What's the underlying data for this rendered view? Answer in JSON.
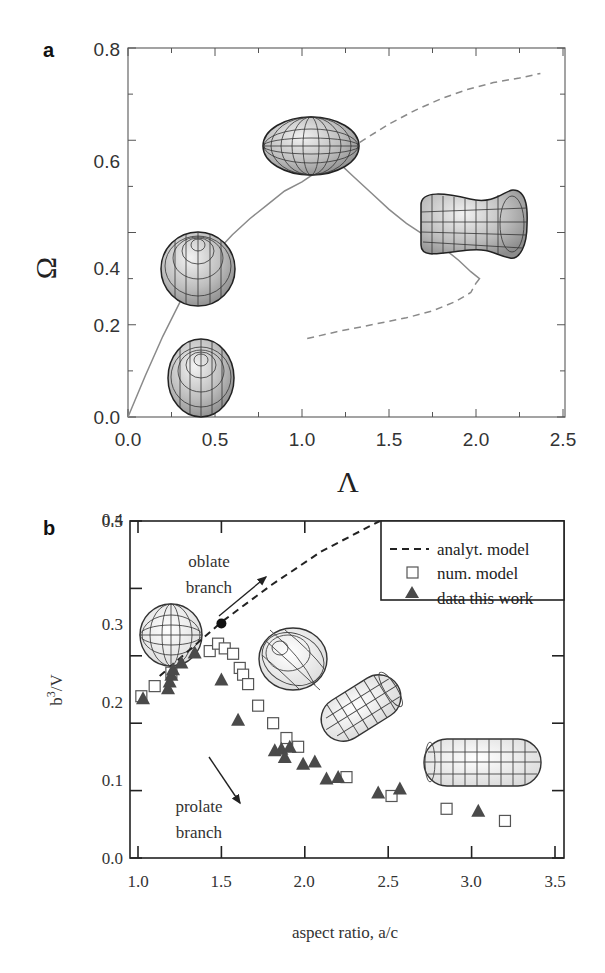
{
  "chart_data": [
    {
      "panel": "a",
      "type": "line",
      "title": "",
      "xlabel": "Λ",
      "ylabel": "Ω",
      "xlim": [
        0.0,
        2.5
      ],
      "ylim": [
        0.0,
        0.8
      ],
      "xticks": [
        "0.0",
        "0.5",
        "1.0",
        "1.5",
        "2.0",
        "2.5"
      ],
      "yticks": [
        "0.0",
        "0.2",
        "0.4",
        "0.6",
        "0.8"
      ],
      "grid": false,
      "series": [
        {
          "name": "stable branch (solid)",
          "style": "solid",
          "x": [
            0.0,
            0.1,
            0.2,
            0.3,
            0.4,
            0.5,
            0.6,
            0.7,
            0.8,
            0.9,
            1.0,
            1.1,
            1.2,
            1.3,
            1.4,
            1.5,
            1.6,
            1.7,
            1.8,
            1.9,
            1.97,
            2.02,
            2.0
          ],
          "y": [
            0.0,
            0.09,
            0.175,
            0.25,
            0.31,
            0.355,
            0.395,
            0.43,
            0.46,
            0.49,
            0.51,
            0.535,
            0.555,
            0.52,
            0.485,
            0.45,
            0.42,
            0.395,
            0.37,
            0.34,
            0.315,
            0.3,
            0.29
          ]
        },
        {
          "name": "upper unstable branch (dashed)",
          "style": "dashed",
          "x": [
            1.22,
            1.35,
            1.5,
            1.65,
            1.8,
            1.95,
            2.1,
            2.25,
            2.37
          ],
          "y": [
            0.565,
            0.6,
            0.635,
            0.665,
            0.69,
            0.71,
            0.725,
            0.735,
            0.745
          ]
        },
        {
          "name": "lower unstable branch (dashed)",
          "style": "dashed",
          "x": [
            1.03,
            1.2,
            1.4,
            1.6,
            1.75,
            1.88,
            1.97,
            2.0
          ],
          "y": [
            0.17,
            0.185,
            0.2,
            0.215,
            0.23,
            0.25,
            0.27,
            0.29
          ]
        }
      ],
      "annotations": [
        "shape: sphere near (0.42, 0.10)",
        "shape: sphere near (0.42, 0.40)",
        "shape: oblate spheroid near (1.05, 0.63)",
        "shape: dumbbell/peanut near (2.1, 0.48)"
      ]
    },
    {
      "panel": "b",
      "type": "scatter",
      "title": "",
      "xlabel": "aspect ratio, a/c",
      "ylabel": "b³/V",
      "xlim": [
        0.95,
        3.55
      ],
      "ylim": [
        0.0,
        0.5
      ],
      "xticks": [
        "1.0",
        "1.5",
        "2.0",
        "2.5",
        "3.0",
        "3.5"
      ],
      "yticks": [
        "0.0",
        "0.1",
        "0.2",
        "0.3",
        "0.4",
        "0.5"
      ],
      "grid": false,
      "legend_position": "upper right",
      "series": [
        {
          "name": "analyt. model",
          "style": "dashed-line",
          "x": [
            1.13,
            1.5,
            1.8,
            2.1,
            2.45
          ],
          "y": [
            0.27,
            0.35,
            0.405,
            0.455,
            0.5
          ]
        },
        {
          "name": "num. model",
          "style": "open-square",
          "x": [
            1.02,
            1.1,
            1.2,
            1.43,
            1.48,
            1.52,
            1.57,
            1.61,
            1.63,
            1.66,
            1.72,
            1.81,
            1.89,
            1.96,
            2.25,
            2.52,
            2.85,
            3.2
          ],
          "y": [
            0.24,
            0.255,
            0.275,
            0.307,
            0.318,
            0.311,
            0.303,
            0.282,
            0.272,
            0.258,
            0.226,
            0.2,
            0.178,
            0.165,
            0.12,
            0.092,
            0.073,
            0.055
          ]
        },
        {
          "name": "data this work",
          "style": "filled-triangle",
          "x": [
            1.03,
            1.18,
            1.19,
            1.2,
            1.21,
            1.26,
            1.34,
            1.5,
            1.6,
            1.82,
            1.86,
            1.88,
            1.91,
            1.99,
            2.06,
            2.13,
            2.2,
            2.44,
            2.57,
            3.04
          ],
          "y": [
            0.237,
            0.252,
            0.262,
            0.272,
            0.28,
            0.29,
            0.305,
            0.265,
            0.205,
            0.16,
            0.162,
            0.15,
            0.165,
            0.14,
            0.143,
            0.118,
            0.12,
            0.097,
            0.103,
            0.07
          ]
        }
      ],
      "highlight_point": {
        "x": 1.5,
        "y": 0.348,
        "style": "filled-circle"
      },
      "annotations": [
        {
          "text_lines": [
            "oblate",
            "branch"
          ],
          "arrow": "up-right"
        },
        {
          "text_lines": [
            "prolate",
            "branch"
          ],
          "arrow": "down-right"
        }
      ]
    }
  ],
  "panel_a": {
    "label": "a",
    "xlabel": "Λ",
    "ylabel": "Ω",
    "xticks": [
      "0.0",
      "0.5",
      "1.0",
      "1.5",
      "2.0",
      "2.5"
    ],
    "yticks": [
      "0.0",
      "0.2",
      "0.4",
      "0.6",
      "0.8"
    ]
  },
  "panel_b": {
    "label": "b",
    "xlabel": "aspect ratio, a/c",
    "ylabel_base": "b",
    "ylabel_sup": "3",
    "ylabel_rest": "/V",
    "xticks": [
      "1.0",
      "1.5",
      "2.0",
      "2.5",
      "3.0",
      "3.5"
    ],
    "yticks": [
      "0.0",
      "0.1",
      "0.2",
      "0.3",
      "0.4",
      "0.5"
    ],
    "legend": {
      "analytic": "analyt. model",
      "numeric": "num. model",
      "data": "data this work"
    },
    "oblate_line1": "oblate",
    "oblate_line2": "branch",
    "prolate_line1": "prolate",
    "prolate_line2": "branch"
  },
  "colors": {
    "curve": "#8a8a8a",
    "axis": "#555555",
    "axis_b": "#222222",
    "marker_fill": "#4a4a4a",
    "shape_fill": "#c8c8c8",
    "shape_grid": "#333333"
  }
}
